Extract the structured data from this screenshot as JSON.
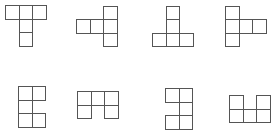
{
  "figure": {
    "cell_size": 13.6,
    "stroke_color": "#555555",
    "background": "#ffffff",
    "shapes": [
      {
        "id": "shape-1",
        "name": "pentomino-T",
        "origin": [
          5,
          5
        ],
        "cells": [
          [
            0,
            0
          ],
          [
            1,
            0
          ],
          [
            2,
            0
          ],
          [
            1,
            1
          ],
          [
            1,
            2
          ]
        ]
      },
      {
        "id": "shape-2",
        "name": "pentomino-T-left",
        "origin": [
          76,
          5.5
        ],
        "cells": [
          [
            2,
            0
          ],
          [
            0,
            1
          ],
          [
            1,
            1
          ],
          [
            2,
            1
          ],
          [
            2,
            2
          ]
        ]
      },
      {
        "id": "shape-3",
        "name": "pentomino-T-inverted",
        "origin": [
          152,
          5.5
        ],
        "cells": [
          [
            1,
            0
          ],
          [
            1,
            1
          ],
          [
            0,
            2
          ],
          [
            1,
            2
          ],
          [
            2,
            2
          ]
        ]
      },
      {
        "id": "shape-4",
        "name": "pentomino-T-right",
        "origin": [
          225,
          5.5
        ],
        "cells": [
          [
            0,
            0
          ],
          [
            0,
            1
          ],
          [
            1,
            1
          ],
          [
            2,
            1
          ],
          [
            0,
            2
          ]
        ]
      },
      {
        "id": "shape-5",
        "name": "pentomino-U-open-right",
        "origin": [
          18,
          86
        ],
        "cells": [
          [
            0,
            0
          ],
          [
            1,
            0
          ],
          [
            0,
            1
          ],
          [
            0,
            2
          ],
          [
            1,
            2
          ]
        ]
      },
      {
        "id": "shape-6",
        "name": "pentomino-U-open-down",
        "origin": [
          77,
          91
        ],
        "cells": [
          [
            0,
            0
          ],
          [
            1,
            0
          ],
          [
            2,
            0
          ],
          [
            0,
            1
          ],
          [
            2,
            1
          ]
        ]
      },
      {
        "id": "shape-7",
        "name": "pentomino-U-open-left",
        "origin": [
          165,
          88
        ],
        "cells": [
          [
            0,
            0
          ],
          [
            1,
            0
          ],
          [
            1,
            1
          ],
          [
            0,
            2
          ],
          [
            1,
            2
          ]
        ]
      },
      {
        "id": "shape-8",
        "name": "pentomino-U-open-up",
        "origin": [
          229,
          95
        ],
        "cells": [
          [
            0,
            0
          ],
          [
            2,
            0
          ],
          [
            0,
            1
          ],
          [
            1,
            1
          ],
          [
            2,
            1
          ]
        ]
      }
    ]
  }
}
